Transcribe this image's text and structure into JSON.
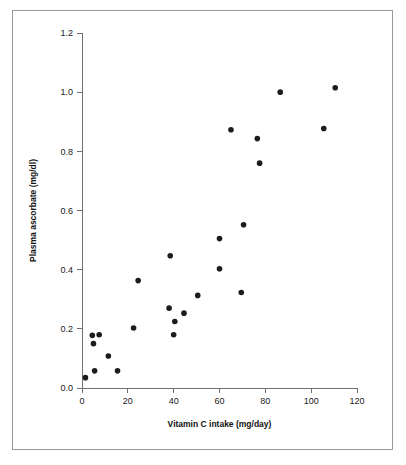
{
  "figure": {
    "background_color": "#ffffff",
    "border_color": "#9a9a9a",
    "point_color": "#1c1c1c",
    "axis_color": "#6f6f6f"
  },
  "chart_data": {
    "type": "scatter",
    "title": "",
    "xlabel": "Vitamin C intake (mg/day)",
    "ylabel": "Plasma ascorbate (mg/dl)",
    "xlim": [
      0,
      120
    ],
    "ylim": [
      0.0,
      1.2
    ],
    "xticks": [
      0,
      20,
      40,
      60,
      80,
      100,
      120
    ],
    "xticklabels": [
      "0",
      "20",
      "40",
      "60",
      "80",
      "100",
      "120"
    ],
    "yticks": [
      0.0,
      0.2,
      0.4,
      0.6,
      0.8,
      1.0,
      1.2
    ],
    "yticklabels": [
      "0.0",
      "0.2",
      "0.4",
      "0.6",
      "0.8",
      "1.0",
      "1.2"
    ],
    "grid": false,
    "legend": false,
    "marker": "filled-circle",
    "marker_size_px": 5.6,
    "series": [
      {
        "name": "subjects",
        "x": [
          1.5,
          4.5,
          5.0,
          7.5,
          11.5,
          15.5,
          22.5,
          24.5,
          38.0,
          38.5,
          40.0,
          40.5,
          44.5,
          50.5,
          60.0,
          60.0,
          65.0,
          69.5,
          70.5,
          71.0,
          76.5,
          77.5,
          86.5,
          105.5,
          110.5
        ],
        "y": [
          0.035,
          0.178,
          0.15,
          0.18,
          0.108,
          0.058,
          0.203,
          0.363,
          0.27,
          0.447,
          0.18,
          0.225,
          0.253,
          0.313,
          0.403,
          0.505,
          0.873,
          0.323,
          0.552,
          0.06,
          0.843,
          0.76,
          1.0,
          0.877,
          1.015
        ]
      }
    ],
    "points": [
      {
        "x": 1.5,
        "y": 0.035
      },
      {
        "x": 4.5,
        "y": 0.178
      },
      {
        "x": 5.0,
        "y": 0.15
      },
      {
        "x": 5.5,
        "y": 0.058
      },
      {
        "x": 7.5,
        "y": 0.18
      },
      {
        "x": 11.5,
        "y": 0.108
      },
      {
        "x": 15.5,
        "y": 0.058
      },
      {
        "x": 22.5,
        "y": 0.203
      },
      {
        "x": 24.5,
        "y": 0.363
      },
      {
        "x": 38.0,
        "y": 0.27
      },
      {
        "x": 38.5,
        "y": 0.447
      },
      {
        "x": 40.0,
        "y": 0.18
      },
      {
        "x": 40.5,
        "y": 0.225
      },
      {
        "x": 44.5,
        "y": 0.253
      },
      {
        "x": 50.5,
        "y": 0.313
      },
      {
        "x": 60.0,
        "y": 0.403
      },
      {
        "x": 60.0,
        "y": 0.505
      },
      {
        "x": 65.0,
        "y": 0.873
      },
      {
        "x": 69.5,
        "y": 0.323
      },
      {
        "x": 70.5,
        "y": 0.552
      },
      {
        "x": 76.5,
        "y": 0.843
      },
      {
        "x": 77.5,
        "y": 0.76
      },
      {
        "x": 86.5,
        "y": 1.0
      },
      {
        "x": 105.5,
        "y": 0.877
      },
      {
        "x": 110.5,
        "y": 1.015
      }
    ]
  }
}
